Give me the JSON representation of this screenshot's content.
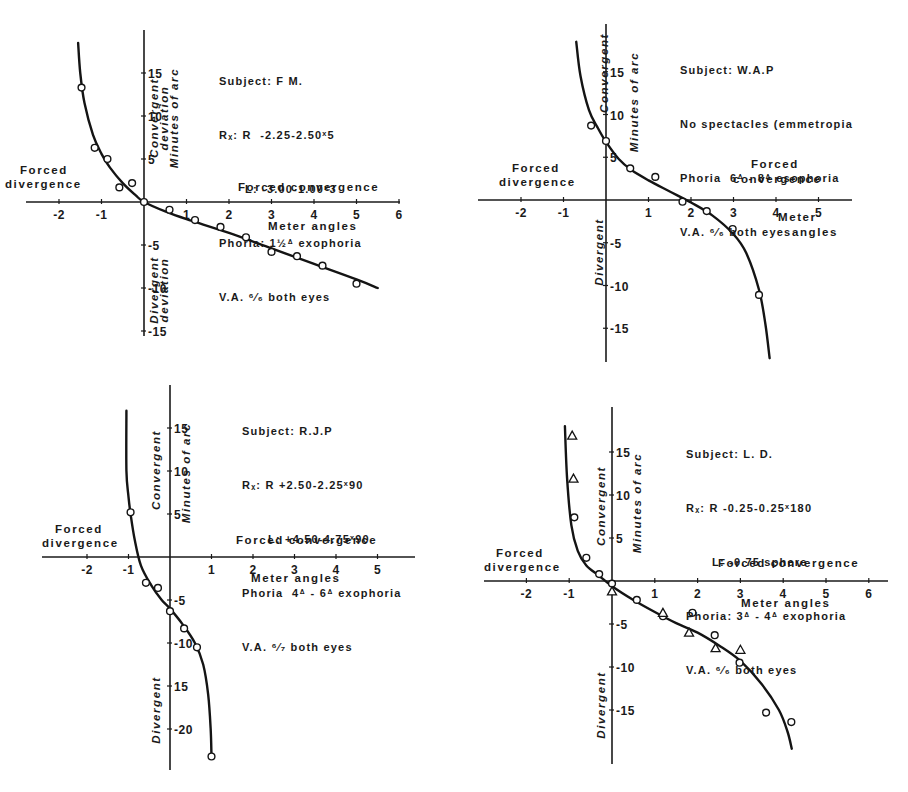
{
  "chart_data": [
    {
      "type": "scatter",
      "title": "Subject: F.M.",
      "annotations": [
        "Subject: F.M.",
        "Rx: R -2.25-2.50x5",
        "L: -3.00-1.00x3",
        "Phoria: 1 1/2Δ exophoria",
        "V.A. 6/6 both eyes"
      ],
      "xlabel": "Meter angles",
      "ylabel": "Minutes of arc",
      "region_labels": [
        "Convergent deviation",
        "Divergent deviation",
        "Forced divergence",
        "Forced convergence"
      ],
      "x_ticks": [
        -2,
        -1,
        1,
        2,
        3,
        4,
        5,
        6
      ],
      "y_ticks": [
        15,
        10,
        5,
        -5,
        -10,
        -15
      ],
      "xlim": [
        -2.7,
        6.0
      ],
      "ylim": [
        -15,
        19
      ],
      "grid": false,
      "series": [
        {
          "name": "observed",
          "marker": "circle",
          "x": [
            -1.47,
            -1.16,
            -0.86,
            -0.58,
            -0.28,
            0.0,
            0.6,
            1.2,
            1.8,
            2.4,
            3.0,
            3.6,
            4.2,
            5.0
          ],
          "y": [
            13.3,
            6.3,
            5.0,
            1.7,
            2.2,
            0.0,
            -0.9,
            -2.1,
            -2.9,
            -4.1,
            -5.8,
            -6.3,
            -7.4,
            -9.5
          ]
        },
        {
          "name": "fitted curve",
          "marker": "line",
          "x": [
            -1.55,
            -1.5,
            -1.4,
            -1.2,
            -1.0,
            -0.8,
            -0.5,
            -0.2,
            0.0,
            0.5,
            1.0,
            2.0,
            3.0,
            4.0,
            5.0,
            5.5
          ],
          "y": [
            18.5,
            15.0,
            11.5,
            7.8,
            5.6,
            4.0,
            2.2,
            0.8,
            0.0,
            -1.1,
            -2.0,
            -3.6,
            -5.4,
            -7.2,
            -9.0,
            -10.0
          ]
        }
      ]
    },
    {
      "type": "scatter",
      "title": "Subject: W.A.P",
      "annotations": [
        "Subject: W.A.P",
        "No spectacles (emmetropia",
        "Phoria 6Δ - 8Δ esophoria",
        "V.A. 6/6 both eyes"
      ],
      "xlabel": "Meter angles",
      "ylabel": "Minutes of arc",
      "region_labels": [
        "Convergent",
        "Divergent",
        "Forced divergence",
        "Forced convergence"
      ],
      "x_ticks": [
        -2,
        -1,
        1,
        2,
        3,
        4,
        5
      ],
      "y_ticks": [
        15,
        10,
        5,
        -5,
        -10,
        -15
      ],
      "xlim": [
        -3.0,
        5.8
      ],
      "ylim": [
        -19,
        20
      ],
      "grid": false,
      "series": [
        {
          "name": "observed",
          "marker": "circle",
          "x": [
            -0.35,
            0.0,
            0.57,
            1.16,
            1.8,
            2.37,
            2.98,
            3.6
          ],
          "y": [
            8.7,
            6.9,
            3.7,
            2.7,
            -0.2,
            -1.3,
            -3.4,
            -11.1
          ]
        },
        {
          "name": "fitted curve",
          "marker": "line",
          "x": [
            -0.7,
            -0.6,
            -0.4,
            -0.2,
            0.0,
            0.3,
            0.6,
            1.0,
            1.5,
            2.0,
            2.5,
            3.0,
            3.3,
            3.6,
            3.75,
            3.85
          ],
          "y": [
            18.5,
            14.5,
            10.5,
            8.5,
            6.8,
            4.8,
            3.5,
            2.3,
            1.0,
            -0.3,
            -1.8,
            -4.0,
            -6.2,
            -10.5,
            -14.5,
            -18.5
          ]
        }
      ]
    },
    {
      "type": "scatter",
      "title": "Subject: R.J.P",
      "annotations": [
        "Subject: R.J.P",
        "Rx: R +2.50-2.25x90",
        "L: +4.50-4.75x90",
        "Phoria 4Δ - 6Δ exophoria",
        "V.A. 6/7 both eyes"
      ],
      "xlabel": "Meter angles",
      "ylabel": "Minutes of arc",
      "region_labels": [
        "Convergent",
        "Divergent",
        "Forced divergence",
        "Forced convergence"
      ],
      "x_ticks": [
        -2,
        -1,
        1,
        2,
        3,
        4,
        5
      ],
      "y_ticks": [
        15,
        10,
        5,
        -5,
        -10,
        -15,
        -20
      ],
      "y_tick_labels": [
        "15",
        "10",
        "5",
        "-5",
        "-10",
        "15",
        "-20"
      ],
      "xlim": [
        -3.0,
        5.8
      ],
      "ylim": [
        -25,
        18
      ],
      "grid": false,
      "series": [
        {
          "name": "observed",
          "marker": "circle",
          "x": [
            -0.95,
            -0.58,
            -0.29,
            0.0,
            0.34,
            0.65,
            1.0
          ],
          "y": [
            5.2,
            -3.0,
            -3.6,
            -6.3,
            -8.3,
            -10.5,
            -23.2
          ]
        },
        {
          "name": "fitted curve",
          "marker": "line",
          "x": [
            -1.05,
            -1.05,
            -1.0,
            -0.95,
            -0.85,
            -0.7,
            -0.45,
            -0.2,
            0.0,
            0.3,
            0.6,
            0.8,
            0.92,
            0.98,
            1.0
          ],
          "y": [
            17.0,
            10.0,
            7.0,
            5.0,
            2.0,
            -1.0,
            -3.3,
            -5.0,
            -6.0,
            -7.8,
            -10.0,
            -12.5,
            -16.0,
            -20.0,
            -23.2
          ]
        }
      ]
    },
    {
      "type": "scatter",
      "title": "Subject: L.D.",
      "annotations": [
        "Subject: L.D.",
        "Rx: R -0.25-0.25x180",
        "L: -0.75 sphere",
        "Phoria: 3Δ - 4Δ exophoria",
        "V.A. 6/6 both eyes"
      ],
      "xlabel": "Meter angles",
      "ylabel": "Minutes of arc",
      "region_labels": [
        "Convergent",
        "Divergent",
        "Forced divergence",
        "Forced convergence"
      ],
      "x_ticks": [
        -2,
        -1,
        1,
        2,
        3,
        4,
        5,
        6
      ],
      "y_ticks": [
        15,
        10,
        5,
        -5,
        -10,
        -15
      ],
      "xlim": [
        -3.0,
        6.4
      ],
      "ylim": [
        -21,
        19
      ],
      "grid": false,
      "series": [
        {
          "name": "circles",
          "marker": "circle",
          "x": [
            -0.88,
            -0.6,
            -0.3,
            0.0,
            0.58,
            1.19,
            1.88,
            2.4,
            2.98,
            3.6,
            4.19
          ],
          "y": [
            7.4,
            2.7,
            0.8,
            -0.3,
            -2.2,
            -4.1,
            -3.7,
            -6.3,
            -9.5,
            -15.3,
            -16.4
          ]
        },
        {
          "name": "triangles",
          "marker": "triangle",
          "x": [
            -0.93,
            -0.9,
            0.0,
            1.19,
            1.8,
            2.42,
            3.0
          ],
          "y": [
            16.9,
            11.9,
            -1.2,
            -3.7,
            -6.0,
            -7.8,
            -8.0
          ]
        },
        {
          "name": "fitted curve",
          "marker": "line",
          "x": [
            -1.1,
            -1.05,
            -0.95,
            -0.8,
            -0.6,
            -0.3,
            0.0,
            0.5,
            1.0,
            1.5,
            2.0,
            2.5,
            3.0,
            3.5,
            3.9,
            4.1,
            4.2
          ],
          "y": [
            18.0,
            12.0,
            6.5,
            3.5,
            1.8,
            0.6,
            -0.6,
            -2.2,
            -3.6,
            -4.9,
            -6.0,
            -7.5,
            -9.3,
            -12.0,
            -15.0,
            -17.5,
            -19.5
          ]
        }
      ]
    }
  ],
  "panels": [
    {
      "info": {
        "subject": "Subject: F M.",
        "rx": "Rₓ: R  -2.25-2.50ˣ5",
        "rx_left": "L: -3.00-1.00ˣ3",
        "phoria": "Phoria: 1½ᐞ exophoria",
        "va": "V.A. ⁶⁄₆ both eyes"
      },
      "labels": {
        "conv": "Convergent",
        "conv2": "deviation",
        "div": "Divergent",
        "div2": "deviation",
        "units": "Minutes of arc",
        "forced_div_1": "Forced",
        "forced_div_2": "divergence",
        "forced_conv_1": "Forced convergence",
        "forced_conv_2": "",
        "xaxis": "Meter angles"
      }
    },
    {
      "info": {
        "subject": "Subject: W.A.P",
        "rx": "No spectacles (emmetropia",
        "rx_left": "",
        "phoria": "Phoria  6ᐞ - 8ᐞ esophoria",
        "va": "V.A. ⁶⁄₆ both eyes"
      },
      "labels": {
        "conv": "Convergent",
        "conv2": "",
        "div": "Divergent",
        "div2": "",
        "units": "Minutes of arc",
        "forced_div_1": "Forced",
        "forced_div_2": "divergence",
        "forced_conv_1": "Forced",
        "forced_conv_2": "convergence",
        "xaxis": "Meter",
        "xaxis2": "angles"
      }
    },
    {
      "info": {
        "subject": "Subject: R.J.P",
        "rx": "Rₓ: R +2.50-2.25ˣ90",
        "rx_left": "L: +4.50-4.75ˣ90",
        "phoria": "Phoria  4ᐞ - 6ᐞ exophoria",
        "va": "V.A. ⁶⁄₇ both eyes"
      },
      "labels": {
        "conv": "Convergent",
        "conv2": "",
        "div": "Divergent",
        "div2": "",
        "units": "Minutes of arc",
        "forced_div_1": "Forced",
        "forced_div_2": "divergence",
        "forced_conv_1": "Forced convergence",
        "forced_conv_2": "",
        "xaxis": "Meter angles"
      }
    },
    {
      "info": {
        "subject": "Subject: L. D.",
        "rx": "Rₓ: R -0.25-0.25ˣ180",
        "rx_left": "L: -0.75 sphere",
        "phoria": "Phoria: 3ᐞ - 4ᐞ exophoria",
        "va": "V.A. ⁶⁄₆ both eyes"
      },
      "labels": {
        "conv": "Convergent",
        "conv2": "",
        "div": "Divergent",
        "div2": "",
        "units": "Minutes of arc",
        "forced_div_1": "Forced",
        "forced_div_2": "divergence",
        "forced_conv_1": "Forced convergence",
        "forced_conv_2": "",
        "xaxis": "Meter angles"
      }
    }
  ],
  "layout": [
    {
      "ox": 144,
      "oy": 202,
      "sx": 42.5,
      "sy": 8.6,
      "axis_x": [
        26,
        400
      ],
      "axis_y": [
        30,
        336
      ]
    },
    {
      "ox": 606,
      "oy": 200,
      "sx": 42.5,
      "sy": 8.55,
      "axis_x": [
        478,
        852
      ],
      "axis_y": [
        24,
        362
      ]
    },
    {
      "ox": 170,
      "oy": 557,
      "sx": 41.5,
      "sy": 8.6,
      "axis_x": [
        42,
        415
      ],
      "axis_y": [
        385,
        770
      ]
    },
    {
      "ox": 612,
      "oy": 581,
      "sx": 42.8,
      "sy": 8.6,
      "axis_x": [
        484,
        888
      ],
      "axis_y": [
        407,
        764
      ]
    }
  ]
}
